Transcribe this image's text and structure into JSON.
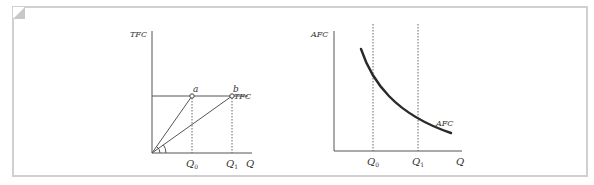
{
  "figure": {
    "background": "#ffffff",
    "frame_color": "#cfcfcf",
    "line_color": "#444444",
    "curve_color": "#2a2a2a"
  },
  "left_panel": {
    "y_axis_label": "TFC",
    "x_axis_label": "Q",
    "line_label": "TFC",
    "point_a_label": "a",
    "point_b_label": "b",
    "tick_q0": "Q",
    "tick_q0_sub": "0",
    "tick_q1": "Q",
    "tick_q1_sub": "1"
  },
  "right_panel": {
    "y_axis_label": "AFC",
    "x_axis_label": "Q",
    "curve_label": "AFC",
    "tick_q0": "Q",
    "tick_q0_sub": "0",
    "tick_q1": "Q",
    "tick_q1_sub": "1"
  }
}
